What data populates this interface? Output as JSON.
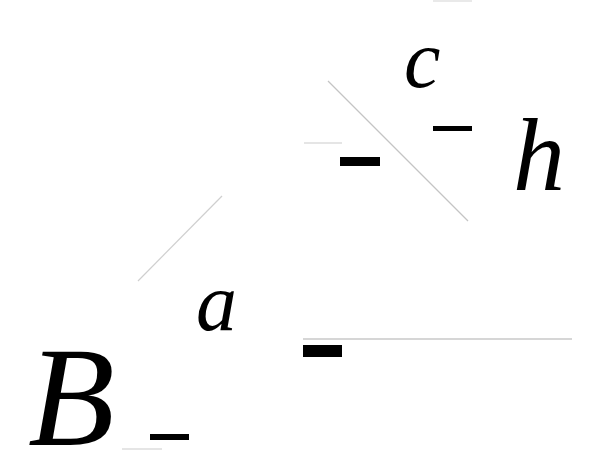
{
  "diagram": {
    "labels": {
      "B": "B",
      "a": "a",
      "c": "c",
      "h": "h"
    },
    "colors": {
      "ink": "#000000",
      "faint_line": "#c8c8c8",
      "background": "#ffffff"
    },
    "lines": [
      {
        "name": "diagonal-line-upper",
        "x1": 328,
        "y1": 81,
        "x2": 468,
        "y2": 221
      },
      {
        "name": "diagonal-line-lower",
        "x1": 222,
        "y1": 196,
        "x2": 138,
        "y2": 281
      },
      {
        "name": "horizontal-line-long",
        "x1": 303,
        "y1": 339,
        "x2": 572,
        "y2": 339
      },
      {
        "name": "horizontal-line-short-left",
        "x1": 304,
        "y1": 143,
        "x2": 342,
        "y2": 143
      },
      {
        "name": "horizontal-line-under-B",
        "x1": 122,
        "y1": 449,
        "x2": 162,
        "y2": 449
      },
      {
        "name": "horizontal-line-top",
        "x1": 433,
        "y1": 1,
        "x2": 472,
        "y2": 1
      }
    ]
  }
}
